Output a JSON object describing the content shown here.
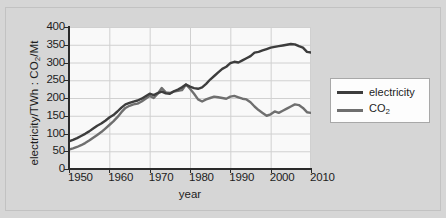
{
  "figure": {
    "background_color": "#d6d6d6",
    "plot_background_color": "#f9f9f9",
    "grid_color": "#d0d0d0",
    "axis_color": "#2b2b2b"
  },
  "axes": {
    "ylabel_prefix": "electricity/TWh : CO",
    "ylabel_sub": "2",
    "ylabel_suffix": "/Mt",
    "xlabel": "year",
    "yticks": [
      "0",
      "50",
      "100",
      "150",
      "200",
      "250",
      "300",
      "350",
      "400"
    ],
    "xticks": [
      "1950",
      "1960",
      "1970",
      "1980",
      "1990",
      "2000",
      "2010"
    ]
  },
  "legend": {
    "position": "right",
    "entries": [
      {
        "label": "electricity",
        "color": "#3d3d3d"
      },
      {
        "label_prefix": "CO",
        "label_sub": "2",
        "color": "#6f6f6f"
      }
    ]
  },
  "chart_data": {
    "type": "line",
    "title": "",
    "xlabel": "year",
    "ylabel": "electricity/TWh : CO2/Mt",
    "xlim": [
      1950,
      2010
    ],
    "ylim": [
      0,
      400
    ],
    "grid": true,
    "legend_position": "right",
    "x": [
      1950,
      1951,
      1952,
      1953,
      1954,
      1955,
      1956,
      1957,
      1958,
      1959,
      1960,
      1961,
      1962,
      1963,
      1964,
      1965,
      1966,
      1967,
      1968,
      1969,
      1970,
      1971,
      1972,
      1973,
      1974,
      1975,
      1976,
      1977,
      1978,
      1979,
      1980,
      1981,
      1982,
      1983,
      1984,
      1985,
      1986,
      1987,
      1988,
      1989,
      1990,
      1991,
      1992,
      1993,
      1994,
      1995,
      1996,
      1997,
      1998,
      1999,
      2000,
      2001,
      2002,
      2003,
      2004,
      2005,
      2006,
      2007,
      2008,
      2009,
      2010
    ],
    "series": [
      {
        "name": "electricity",
        "color": "#3d3d3d",
        "unit": "TWh",
        "values": [
          78,
          82,
          87,
          93,
          99,
          106,
          114,
          122,
          128,
          136,
          145,
          152,
          162,
          173,
          182,
          186,
          190,
          193,
          198,
          205,
          212,
          208,
          214,
          218,
          213,
          212,
          219,
          224,
          230,
          238,
          232,
          228,
          226,
          230,
          240,
          252,
          262,
          272,
          282,
          288,
          298,
          302,
          300,
          306,
          312,
          318,
          328,
          330,
          334,
          338,
          342,
          344,
          346,
          348,
          350,
          352,
          351,
          346,
          342,
          330,
          328
        ]
      },
      {
        "name": "CO2",
        "color": "#6f6f6f",
        "unit": "Mt",
        "values": [
          55,
          58,
          62,
          67,
          73,
          80,
          88,
          96,
          104,
          114,
          124,
          134,
          146,
          160,
          172,
          178,
          182,
          184,
          190,
          198,
          206,
          200,
          212,
          228,
          216,
          214,
          218,
          220,
          222,
          238,
          226,
          212,
          196,
          190,
          196,
          200,
          204,
          202,
          200,
          198,
          204,
          206,
          202,
          198,
          196,
          188,
          176,
          166,
          158,
          150,
          154,
          162,
          158,
          164,
          170,
          176,
          182,
          180,
          172,
          160,
          158
        ]
      }
    ]
  }
}
